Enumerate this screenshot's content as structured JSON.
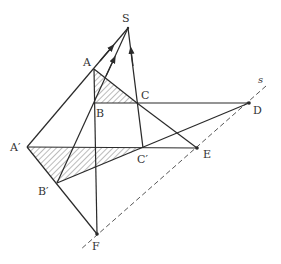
{
  "figure": {
    "type": "perspective-collineation-diagram",
    "colors": {
      "line": "#2a2a2a",
      "label": "#333333",
      "background": "#ffffff",
      "hatch": "#555555"
    },
    "points": [
      {
        "id": "S",
        "label": "S",
        "x": 128,
        "y": 28,
        "lx": 122,
        "ly": 22
      },
      {
        "id": "A",
        "label": "A",
        "x": 94,
        "y": 69,
        "lx": 83,
        "ly": 66
      },
      {
        "id": "B",
        "label": "B",
        "x": 94,
        "y": 103,
        "lx": 96,
        "ly": 117
      },
      {
        "id": "C",
        "label": "C",
        "x": 137,
        "y": 103,
        "lx": 141,
        "ly": 99
      },
      {
        "id": "D",
        "label": "D",
        "x": 249,
        "y": 103,
        "lx": 253,
        "ly": 114
      },
      {
        "id": "A1",
        "label": "A′",
        "x": 27,
        "y": 147,
        "lx": 10,
        "ly": 151
      },
      {
        "id": "B1",
        "label": "B′",
        "x": 57,
        "y": 183,
        "lx": 38,
        "ly": 195
      },
      {
        "id": "C1",
        "label": "C′",
        "x": 143,
        "y": 148,
        "lx": 137,
        "ly": 163
      },
      {
        "id": "E",
        "label": "E",
        "x": 197,
        "y": 148,
        "lx": 203,
        "ly": 158
      },
      {
        "id": "F",
        "label": "F",
        "x": 97,
        "y": 234,
        "lx": 92,
        "ly": 250
      }
    ],
    "axis_label": {
      "text": "s",
      "x": 258,
      "y": 83
    }
  }
}
